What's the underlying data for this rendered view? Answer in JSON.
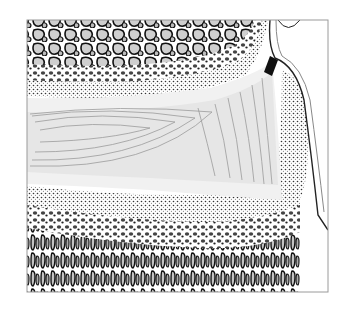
{
  "figure": {
    "type": "anatomical-illustration",
    "style": "black-and-white stippled engraving",
    "frame": {
      "x": 27,
      "y": 20,
      "width": 301,
      "height": 272,
      "border": "#9a9a9a"
    },
    "regions": [
      {
        "name": "spongy-bone-top",
        "description": "trabecular bone with large cells"
      },
      {
        "name": "cartilage-band",
        "description": "pale curved band with concentric lines"
      },
      {
        "name": "joint-notch",
        "description": "dark wedge at upper right"
      },
      {
        "name": "periosteum-right",
        "description": "curved membrane along right edge"
      },
      {
        "name": "spongy-bone-bottom",
        "description": "trabecular bone, fine dots grading to large cells"
      }
    ],
    "colors": {
      "background": "#ffffff",
      "ink": "#1a1a1a",
      "cartilage": "#e6e6e6",
      "cartilage_lines": "#9a9a9a",
      "band_light": "#f1f1f1"
    }
  }
}
